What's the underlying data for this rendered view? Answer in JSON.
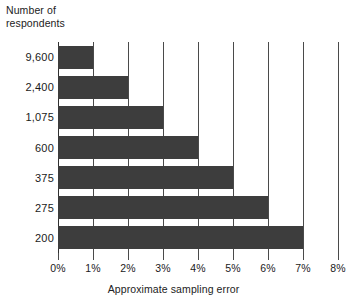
{
  "chart_data": {
    "type": "bar",
    "orientation": "horizontal",
    "title": "",
    "categories": [
      "9,600",
      "2,400",
      "1,075",
      "600",
      "375",
      "275",
      "200"
    ],
    "values": [
      1,
      2,
      3,
      4,
      5,
      6,
      7
    ],
    "value_labels": [
      "1%",
      "2%",
      "3%",
      "4%",
      "5%",
      "6%",
      "7%"
    ],
    "xlabel": "Approximate sampling error",
    "ylabel": "Number of\nrespondents",
    "xlim": [
      0,
      8
    ],
    "xticks": [
      0,
      1,
      2,
      3,
      4,
      5,
      6,
      7,
      8
    ],
    "xtick_labels": [
      "0%",
      "1%",
      "2%",
      "3%",
      "4%",
      "5%",
      "6%",
      "7%",
      "8%"
    ],
    "grid": "vertical",
    "legend": "none",
    "bar_color": "#3d3d3d",
    "gridline_color": "#4a4a4a",
    "background_color": "#ffffff"
  }
}
